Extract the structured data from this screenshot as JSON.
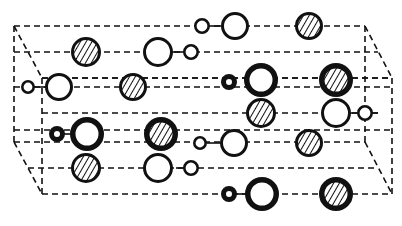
{
  "diagram": {
    "colors": {
      "ink": "#111111",
      "background": "#ffffff",
      "hatch": "#111111"
    },
    "legend_kinds": {
      "hatched": "hatched atom (filled with diagonal stripes)",
      "open-thin": "open atom, thin outline",
      "open-thick": "open atom, thick outline",
      "small-thick": "small atom, thick outline",
      "small-thin": "small atom, thin outline"
    },
    "atoms": [
      {
        "id": "a1",
        "kind": "hatched",
        "weight": "normal"
      },
      {
        "id": "a2",
        "kind": "open-thin",
        "weight": "normal"
      },
      {
        "id": "a3",
        "kind": "small-thin",
        "weight": "normal"
      },
      {
        "id": "a4",
        "kind": "small-thin",
        "weight": "normal"
      },
      {
        "id": "a5",
        "kind": "open-thin",
        "weight": "normal"
      },
      {
        "id": "a6",
        "kind": "hatched",
        "weight": "normal"
      },
      {
        "id": "a7",
        "kind": "small-thin",
        "weight": "normal"
      },
      {
        "id": "a8",
        "kind": "open-thin",
        "weight": "normal"
      },
      {
        "id": "a9",
        "kind": "hatched",
        "weight": "normal"
      },
      {
        "id": "a10",
        "kind": "small-thick",
        "weight": "heavy"
      },
      {
        "id": "a11",
        "kind": "open-thick",
        "weight": "heavy"
      },
      {
        "id": "a12",
        "kind": "hatched",
        "weight": "heavy"
      },
      {
        "id": "a13",
        "kind": "hatched",
        "weight": "normal"
      },
      {
        "id": "a14",
        "kind": "open-thin",
        "weight": "normal"
      },
      {
        "id": "a15",
        "kind": "small-thin",
        "weight": "normal"
      },
      {
        "id": "a16",
        "kind": "small-thick",
        "weight": "heavy"
      },
      {
        "id": "a17",
        "kind": "open-thick",
        "weight": "heavy"
      },
      {
        "id": "a18",
        "kind": "hatched",
        "weight": "heavy"
      },
      {
        "id": "a19",
        "kind": "small-thin",
        "weight": "normal"
      },
      {
        "id": "a20",
        "kind": "open-thin",
        "weight": "normal"
      },
      {
        "id": "a21",
        "kind": "hatched",
        "weight": "normal"
      },
      {
        "id": "a22",
        "kind": "hatched",
        "weight": "normal"
      },
      {
        "id": "a23",
        "kind": "open-thin",
        "weight": "normal"
      },
      {
        "id": "a24",
        "kind": "small-thin",
        "weight": "normal"
      },
      {
        "id": "a25",
        "kind": "small-thick",
        "weight": "heavy"
      },
      {
        "id": "a26",
        "kind": "open-thick",
        "weight": "heavy"
      },
      {
        "id": "a27",
        "kind": "hatched",
        "weight": "heavy"
      }
    ]
  }
}
